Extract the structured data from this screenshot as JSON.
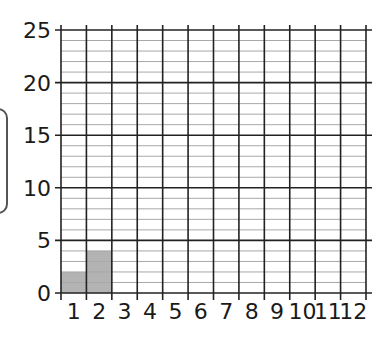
{
  "chart_data": {
    "type": "bar",
    "title": "",
    "xlabel": "",
    "ylabel": "",
    "categories": [
      "1",
      "2",
      "3",
      "4",
      "5",
      "6",
      "7",
      "8",
      "9",
      "10",
      "11",
      "12"
    ],
    "values": [
      2,
      4,
      null,
      null,
      null,
      null,
      null,
      null,
      null,
      null,
      null,
      null
    ],
    "ylim": [
      0,
      25
    ],
    "y_ticks": [
      0,
      5,
      10,
      15,
      20,
      25
    ],
    "y_minor_step": 1,
    "grid": true,
    "bar_color": "#b3b3b3"
  }
}
